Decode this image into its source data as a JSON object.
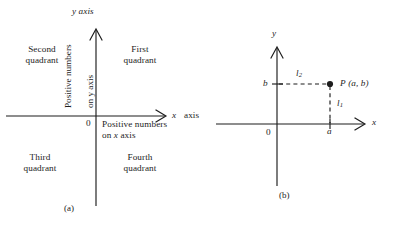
{
  "figure": {
    "caption_a": "(a)",
    "caption_b": "(b)"
  },
  "panel_a": {
    "y_axis_label": "y axis",
    "x_axis_label_var": "x",
    "x_axis_label_word": "axis",
    "origin_label": "0",
    "quadrants": [
      {
        "line1": "Second",
        "line2": "quadrant"
      },
      {
        "line1": "First",
        "line2": "quadrant"
      },
      {
        "line1": "Third",
        "line2": "quadrant"
      },
      {
        "line1": "Fourth",
        "line2": "quadrant"
      }
    ],
    "positive_y_line1": "Positive numbers",
    "positive_y_line2": "on y axis",
    "positive_x_line1": "Positive numbers",
    "positive_x_line2a": "on ",
    "positive_x_line2b": "x",
    "positive_x_line2c": " axis"
  },
  "panel_b": {
    "y_axis_label": "y",
    "x_axis_label": "x",
    "origin_label": "0",
    "x_tick_label": "a",
    "y_tick_label": "b",
    "point_label_p": "P",
    "point_label_coords": "(a, b)",
    "segment_vertical": "l",
    "segment_vertical_sub": "1",
    "segment_horizontal": "l",
    "segment_horizontal_sub": "2"
  },
  "colors": {
    "ink": "#1d1d1d",
    "background": "#ffffff"
  }
}
